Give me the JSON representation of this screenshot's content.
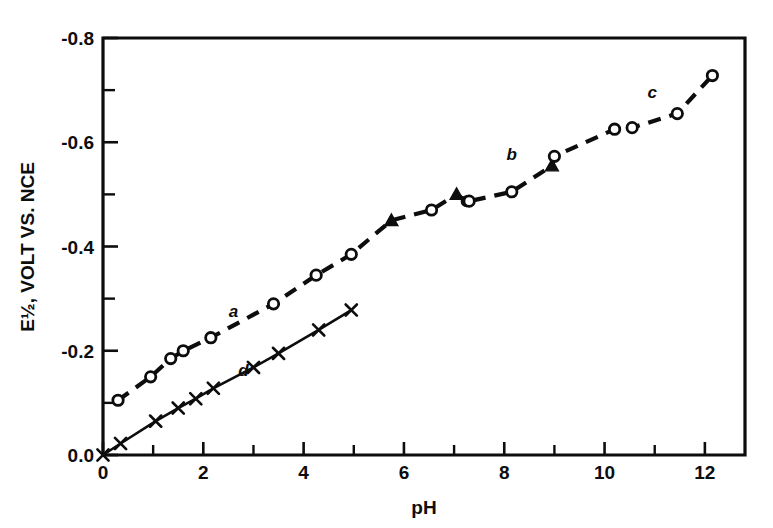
{
  "figure": {
    "background": "#ffffff",
    "ink_color": "#0d0d0d"
  },
  "axes": {
    "x_title": "pH",
    "y_title": "E½, VOLT VS. NCE",
    "x_ticks": [
      "0",
      "2",
      "4",
      "6",
      "8",
      "10",
      "12"
    ],
    "y_ticks": [
      "0.0",
      "-0.2",
      "-0.4",
      "-0.6",
      "-0.8"
    ]
  },
  "curve_labels": {
    "a": "a",
    "b": "b",
    "c": "c",
    "d": "d"
  },
  "chart_data": {
    "type": "scatter",
    "title": "",
    "xlabel": "pH",
    "ylabel": "E½, VOLT VS. NCE",
    "xlim": [
      0,
      12.8
    ],
    "ylim": [
      0.0,
      -0.8
    ],
    "grid": false,
    "legend": "inline-curve-labels",
    "x_ticks_major": [
      0,
      2,
      4,
      6,
      8,
      10,
      12
    ],
    "x_ticks_minor": [
      1,
      3,
      5,
      7,
      9,
      11
    ],
    "y_ticks_major": [
      0.0,
      -0.2,
      -0.4,
      -0.6,
      -0.8
    ],
    "y_ticks_minor": [
      -0.1,
      -0.3,
      -0.5,
      -0.7
    ],
    "series": [
      {
        "name": "a",
        "marker": "open-circle",
        "line": "dashed",
        "label_position": {
          "x": 2.6,
          "y": -0.265
        },
        "points": [
          {
            "x": 0.3,
            "y": -0.105
          },
          {
            "x": 0.95,
            "y": -0.15
          },
          {
            "x": 1.35,
            "y": -0.185
          },
          {
            "x": 1.6,
            "y": -0.2
          },
          {
            "x": 2.15,
            "y": -0.225
          },
          {
            "x": 3.4,
            "y": -0.29
          },
          {
            "x": 4.25,
            "y": -0.345
          },
          {
            "x": 4.95,
            "y": -0.385
          }
        ]
      },
      {
        "name": "b",
        "marker": "mixed-filled-triangle-and-open-circle",
        "line": "dashed",
        "label_position": {
          "x": 8.15,
          "y": -0.565
        },
        "points": [
          {
            "x": 5.75,
            "y": -0.45,
            "marker": "filled-triangle"
          },
          {
            "x": 6.55,
            "y": -0.47,
            "marker": "open-circle"
          },
          {
            "x": 7.05,
            "y": -0.5,
            "marker": "filled-triangle"
          },
          {
            "x": 7.25,
            "y": -0.487,
            "marker": "filled-circle"
          },
          {
            "x": 7.3,
            "y": -0.487,
            "marker": "open-circle"
          },
          {
            "x": 8.15,
            "y": -0.505,
            "marker": "open-circle"
          },
          {
            "x": 8.95,
            "y": -0.555,
            "marker": "filled-triangle"
          },
          {
            "x": 9.0,
            "y": -0.573,
            "marker": "open-circle"
          }
        ]
      },
      {
        "name": "c",
        "marker": "open-circle",
        "line": "dashed",
        "label_position": {
          "x": 10.95,
          "y": -0.685
        },
        "points": [
          {
            "x": 10.2,
            "y": -0.625
          },
          {
            "x": 10.55,
            "y": -0.628
          },
          {
            "x": 11.45,
            "y": -0.655
          },
          {
            "x": 12.15,
            "y": -0.728
          }
        ]
      },
      {
        "name": "d",
        "marker": "cross-x",
        "line": "solid",
        "label_position": {
          "x": 2.8,
          "y": -0.152
        },
        "points": [
          {
            "x": 0.0,
            "y": 0.0
          },
          {
            "x": 0.35,
            "y": -0.022
          },
          {
            "x": 1.05,
            "y": -0.065
          },
          {
            "x": 1.5,
            "y": -0.09
          },
          {
            "x": 1.85,
            "y": -0.108
          },
          {
            "x": 2.2,
            "y": -0.128
          },
          {
            "x": 3.0,
            "y": -0.168
          },
          {
            "x": 3.5,
            "y": -0.195
          },
          {
            "x": 4.3,
            "y": -0.24
          },
          {
            "x": 4.95,
            "y": -0.278
          }
        ]
      }
    ]
  }
}
